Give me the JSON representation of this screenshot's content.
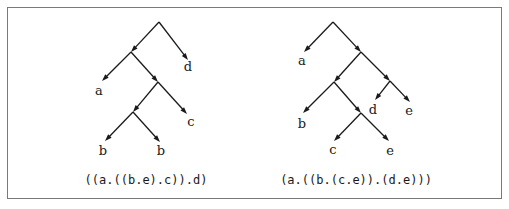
{
  "figure": {
    "border_color": "#7a7a7a",
    "trees": [
      {
        "id": "left-tree",
        "caption": "((a.((b.e).c)).d)",
        "caption_pos": [
          146,
          184
        ],
        "edges": [
          {
            "from": [
              159,
              22
            ],
            "to": [
              131,
              52
            ],
            "arrow": true
          },
          {
            "from": [
              159,
              22
            ],
            "to": [
              188,
              60
            ],
            "arrow": true
          },
          {
            "from": [
              131,
              52
            ],
            "to": [
              102,
              81
            ],
            "arrow": true
          },
          {
            "from": [
              131,
              52
            ],
            "to": [
              158,
              82
            ],
            "arrow": true
          },
          {
            "from": [
              158,
              82
            ],
            "to": [
              133,
              112
            ],
            "arrow": true
          },
          {
            "from": [
              158,
              82
            ],
            "to": [
              187,
              114
            ],
            "arrow": true
          },
          {
            "from": [
              133,
              112
            ],
            "to": [
              105,
              141
            ],
            "arrow": true
          },
          {
            "from": [
              133,
              112
            ],
            "to": [
              160,
              142
            ],
            "arrow": true
          }
        ],
        "leaves": [
          {
            "label": "d",
            "pos": [
              188,
              71
            ]
          },
          {
            "label": "a",
            "pos": [
              99,
              95
            ]
          },
          {
            "label": "c",
            "pos": [
              191,
              126
            ]
          },
          {
            "label": "b",
            "pos": [
              103,
              155
            ]
          },
          {
            "label": "b",
            "pos": [
              161,
              155
            ]
          }
        ]
      },
      {
        "id": "right-tree",
        "caption": "(a.((b.(c.e)).(d.e)))",
        "caption_pos": [
          356,
          184
        ],
        "edges": [
          {
            "from": [
              333,
              22
            ],
            "to": [
              304,
              52
            ],
            "arrow": true
          },
          {
            "from": [
              333,
              22
            ],
            "to": [
              361,
              52
            ],
            "arrow": true
          },
          {
            "from": [
              361,
              52
            ],
            "to": [
              334,
              82
            ],
            "arrow": true
          },
          {
            "from": [
              361,
              52
            ],
            "to": [
              390,
              81
            ],
            "arrow": true
          },
          {
            "from": [
              334,
              82
            ],
            "to": [
              303,
              113
            ],
            "arrow": true
          },
          {
            "from": [
              334,
              82
            ],
            "to": [
              361,
              113
            ],
            "arrow": true
          },
          {
            "from": [
              390,
              81
            ],
            "to": [
              375,
              100
            ],
            "arrow": true
          },
          {
            "from": [
              390,
              81
            ],
            "to": [
              410,
              102
            ],
            "arrow": true
          },
          {
            "from": [
              361,
              113
            ],
            "to": [
              334,
              141
            ],
            "arrow": true
          },
          {
            "from": [
              361,
              113
            ],
            "to": [
              389,
              141
            ],
            "arrow": true
          }
        ],
        "leaves": [
          {
            "label": "a",
            "pos": [
              302,
              65
            ]
          },
          {
            "label": "b",
            "pos": [
              302,
              128
            ]
          },
          {
            "label": "d",
            "pos": [
              373,
              114
            ]
          },
          {
            "label": "e",
            "pos": [
              409,
              115
            ]
          },
          {
            "label": "c",
            "pos": [
              333,
              154
            ]
          },
          {
            "label": "e",
            "pos": [
              390,
              155
            ]
          }
        ]
      }
    ]
  }
}
